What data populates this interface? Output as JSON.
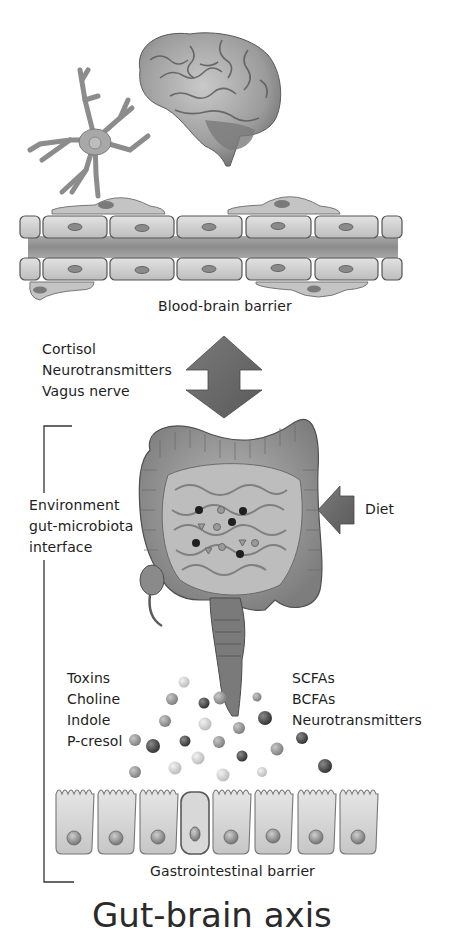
{
  "figure": {
    "top_section": {
      "caption": "Blood-brain barrier",
      "elements": [
        "brain-illustration",
        "astrocyte-illustration",
        "blood-vessel-endothelium"
      ]
    },
    "signals": {
      "items": [
        "Cortisol",
        "Neurotransmitters",
        "Vagus nerve"
      ],
      "arrow": "bidirectional-arrow-icon"
    },
    "gut_section": {
      "bracket_label": [
        "Environment",
        "gut-microbiota",
        "interface"
      ],
      "diet_label": "Diet",
      "diet_arrow": "left-arrow-icon"
    },
    "metabolites": {
      "left": [
        "Toxins",
        "Choline",
        "Indole",
        "P-cresol"
      ],
      "right": [
        "SCFAs",
        "BCFAs",
        "Neurotransmitters"
      ]
    },
    "bottom_section": {
      "caption": "Gastrointestinal barrier",
      "cell_count": 8
    },
    "cropped_title": "Gut-brain axis"
  },
  "colors": {
    "arrow_fill": "#6b6b6b",
    "text": "#1e1e1e",
    "tissue_light": "#d4d4d4",
    "tissue_mid": "#9a9a9a",
    "tissue_dark": "#555555"
  }
}
